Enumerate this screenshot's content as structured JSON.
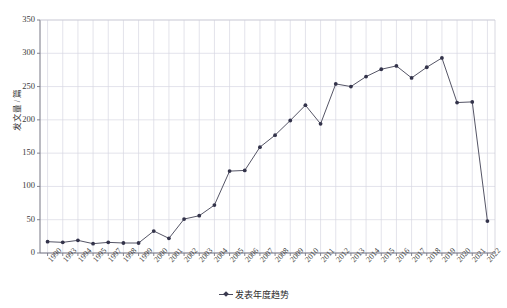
{
  "chart_data": {
    "type": "line",
    "title": "",
    "xlabel": "",
    "ylabel": "发文量 / 篇",
    "ylim": [
      0,
      350
    ],
    "yticks": [
      0,
      50,
      100,
      150,
      200,
      250,
      300,
      350
    ],
    "grid": true,
    "legend_position": "bottom-center",
    "legend": [
      "发表年度趋势"
    ],
    "categories": [
      "1990",
      "1993",
      "1994",
      "1995",
      "1997",
      "1998",
      "1999",
      "2000",
      "2001",
      "2002",
      "2003",
      "2004",
      "2005",
      "2006",
      "2007",
      "2008",
      "2009",
      "2010",
      "2011",
      "2012",
      "2013",
      "2014",
      "2015",
      "2016",
      "2017",
      "2018",
      "2019",
      "2020",
      "2021",
      "2022"
    ],
    "series": [
      {
        "name": "发表年度趋势",
        "values": [
          17,
          16,
          19,
          14,
          16,
          15,
          15,
          33,
          22,
          51,
          56,
          72,
          123,
          124,
          159,
          177,
          199,
          222,
          194,
          254,
          250,
          265,
          276,
          281,
          263,
          279,
          293,
          226,
          227,
          48
        ]
      }
    ],
    "line_color": "#555566",
    "marker_color": "#33334a",
    "grid_color": "#d7d7e2",
    "axis_color": "#888894"
  },
  "axis": {
    "y_title": "发文量 / 篇",
    "y_tick_labels": [
      "0",
      "50",
      "100",
      "150",
      "200",
      "250",
      "300",
      "350"
    ],
    "x_tick_labels": [
      "1990",
      "1993",
      "1994",
      "1995",
      "1997",
      "1998",
      "1999",
      "2000",
      "2001",
      "2002",
      "2003",
      "2004",
      "2005",
      "2006",
      "2007",
      "2008",
      "2009",
      "2010",
      "2011",
      "2012",
      "2013",
      "2014",
      "2015",
      "2016",
      "2017",
      "2018",
      "2019",
      "2020",
      "2021",
      "2022"
    ]
  },
  "legend": {
    "label": "发表年度趋势"
  }
}
